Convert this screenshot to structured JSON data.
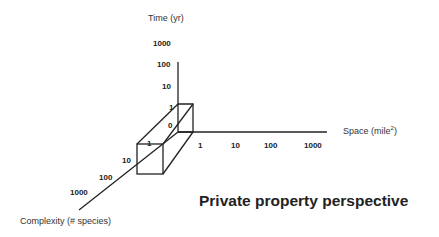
{
  "axes": {
    "time": {
      "label": "Time (yr)",
      "ticks": [
        "1000",
        "100",
        "10",
        "1"
      ]
    },
    "space": {
      "label": "Space (mile",
      "label_sup": "2",
      "label_end": ")",
      "ticks": [
        "1",
        "10",
        "100",
        "1000"
      ]
    },
    "complexity": {
      "label": "Complexity (# species)",
      "ticks": [
        "10",
        "100",
        "1000"
      ]
    }
  },
  "box": {
    "origin_label": "0",
    "front_face_label": "1"
  },
  "title": "Private property perspective",
  "colors": {
    "line": "#222222",
    "text": "#222222",
    "background": "#ffffff"
  }
}
